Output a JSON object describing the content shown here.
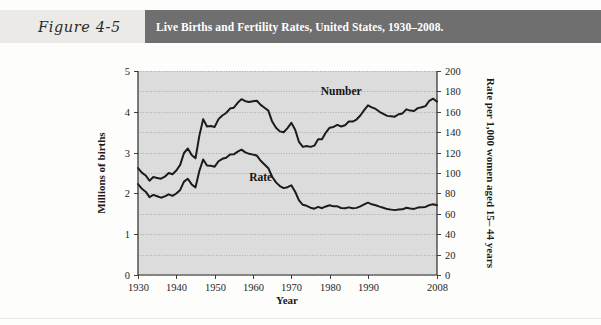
{
  "header": {
    "figure_label": "Figure 4-5",
    "title": "Live Births and Fertility Rates, United States, 1930–2008.",
    "band_color": "#6f6f6f",
    "label_box_color": "#eceae6",
    "title_color": "#ffffff"
  },
  "chart_data": {
    "type": "line",
    "title": "Live Births and Fertility Rates, United States, 1930–2008.",
    "xlabel": "Year",
    "ylabel": "Millions of births",
    "y2label": "Rate per 1,000 women aged 15– 44 years",
    "xlim": [
      1930,
      2008
    ],
    "ylim": [
      0,
      5
    ],
    "y2lim": [
      0,
      200
    ],
    "x_ticks": [
      1930,
      1940,
      1950,
      1960,
      1970,
      1980,
      1990,
      2008
    ],
    "y_ticks": [
      0,
      1,
      2,
      3,
      4,
      5
    ],
    "y2_ticks": [
      0,
      20,
      40,
      60,
      80,
      100,
      120,
      140,
      160,
      180,
      200
    ],
    "grid": true,
    "grid_minor_step_left": 0.5,
    "legend_position": "inline-annotations",
    "plot_background": "#dcdcdc",
    "line_color": "#1b1b1b",
    "annotations": [
      {
        "text": "Number",
        "x": 1983,
        "y_right": 176
      },
      {
        "text": "Rate",
        "x": 1962,
        "y_right": 92
      }
    ],
    "series": [
      {
        "name": "Number",
        "unit": "Millions of births",
        "axis": "left",
        "x": [
          1930,
          1931,
          1932,
          1933,
          1934,
          1935,
          1936,
          1937,
          1938,
          1939,
          1940,
          1941,
          1942,
          1943,
          1944,
          1945,
          1946,
          1947,
          1948,
          1949,
          1950,
          1951,
          1952,
          1953,
          1954,
          1955,
          1956,
          1957,
          1958,
          1959,
          1960,
          1961,
          1962,
          1963,
          1964,
          1965,
          1966,
          1967,
          1968,
          1969,
          1970,
          1971,
          1972,
          1973,
          1974,
          1975,
          1976,
          1977,
          1978,
          1979,
          1980,
          1981,
          1982,
          1983,
          1984,
          1985,
          1986,
          1987,
          1988,
          1989,
          1990,
          1991,
          1992,
          1993,
          1994,
          1995,
          1996,
          1997,
          1998,
          1999,
          2000,
          2001,
          2002,
          2003,
          2004,
          2005,
          2006,
          2007,
          2008
        ],
        "values": [
          2.62,
          2.51,
          2.44,
          2.31,
          2.4,
          2.38,
          2.36,
          2.41,
          2.5,
          2.47,
          2.56,
          2.7,
          2.99,
          3.1,
          2.94,
          2.86,
          3.41,
          3.82,
          3.64,
          3.65,
          3.63,
          3.82,
          3.91,
          3.97,
          4.08,
          4.1,
          4.22,
          4.31,
          4.26,
          4.24,
          4.26,
          4.27,
          4.17,
          4.1,
          4.03,
          3.76,
          3.61,
          3.52,
          3.5,
          3.6,
          3.73,
          3.56,
          3.26,
          3.14,
          3.16,
          3.14,
          3.17,
          3.33,
          3.33,
          3.49,
          3.61,
          3.63,
          3.68,
          3.64,
          3.67,
          3.76,
          3.76,
          3.81,
          3.91,
          4.04,
          4.16,
          4.11,
          4.07,
          4.0,
          3.95,
          3.9,
          3.89,
          3.88,
          3.94,
          3.96,
          4.06,
          4.03,
          4.02,
          4.09,
          4.11,
          4.14,
          4.27,
          4.32,
          4.25
        ]
      },
      {
        "name": "Rate",
        "unit": "Rate per 1,000 women aged 15–44 years",
        "axis": "right",
        "x": [
          1930,
          1931,
          1932,
          1933,
          1934,
          1935,
          1936,
          1937,
          1938,
          1939,
          1940,
          1941,
          1942,
          1943,
          1944,
          1945,
          1946,
          1947,
          1948,
          1949,
          1950,
          1951,
          1952,
          1953,
          1954,
          1955,
          1956,
          1957,
          1958,
          1959,
          1960,
          1961,
          1962,
          1963,
          1964,
          1965,
          1966,
          1967,
          1968,
          1969,
          1970,
          1971,
          1972,
          1973,
          1974,
          1975,
          1976,
          1977,
          1978,
          1979,
          1980,
          1981,
          1982,
          1983,
          1984,
          1985,
          1986,
          1987,
          1988,
          1989,
          1990,
          1991,
          1992,
          1993,
          1994,
          1995,
          1996,
          1997,
          1998,
          1999,
          2000,
          2001,
          2002,
          2003,
          2004,
          2005,
          2006,
          2007,
          2008
        ],
        "values": [
          89.2,
          84.6,
          81.7,
          76.3,
          78.5,
          77.2,
          75.8,
          77.1,
          79.1,
          77.6,
          79.9,
          83.4,
          91.5,
          94.3,
          88.8,
          85.9,
          101.9,
          113.3,
          107.3,
          107.1,
          106.2,
          111.5,
          113.9,
          115.0,
          118.1,
          118.3,
          121.0,
          122.9,
          120.2,
          118.8,
          118.0,
          117.1,
          112.0,
          108.3,
          104.7,
          96.3,
          90.8,
          87.2,
          85.2,
          86.1,
          87.9,
          81.6,
          73.1,
          68.8,
          67.8,
          66.0,
          65.0,
          66.8,
          65.5,
          67.2,
          68.4,
          67.3,
          67.3,
          65.7,
          65.5,
          66.3,
          65.4,
          65.8,
          67.3,
          69.2,
          70.9,
          69.3,
          68.4,
          67.0,
          65.9,
          64.6,
          64.1,
          63.6,
          64.3,
          64.4,
          65.9,
          65.1,
          64.8,
          66.1,
          66.3,
          66.7,
          68.5,
          69.3,
          68.4
        ]
      }
    ]
  }
}
